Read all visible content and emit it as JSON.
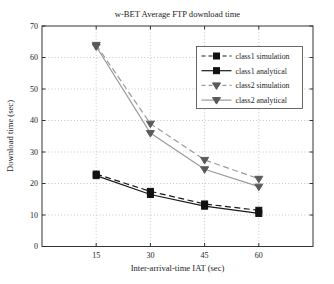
{
  "chart_data": {
    "type": "line",
    "title": "w-BET Average FTP download time",
    "xlabel": "Inter-arrival-time IAT (sec)",
    "ylabel": "Download time (sec)",
    "x": [
      15,
      30,
      45,
      60
    ],
    "xlim": [
      0,
      75
    ],
    "ylim": [
      0,
      70
    ],
    "xticks": [
      15,
      30,
      45,
      60
    ],
    "yticks": [
      0,
      10,
      20,
      30,
      40,
      50,
      60,
      70
    ],
    "grid": true,
    "legend_position": "upper right",
    "series": [
      {
        "name": "class1 simulation",
        "values": [
          23,
          17.5,
          13.5,
          11.5
        ],
        "line_style": "dashed",
        "marker": "square",
        "line_color": "#1a1a1a",
        "marker_color": "#111111"
      },
      {
        "name": "class1 analytical",
        "values": [
          22.5,
          16.5,
          12.8,
          10.5
        ],
        "line_style": "solid",
        "marker": "square",
        "line_color": "#1a1a1a",
        "marker_color": "#111111"
      },
      {
        "name": "class2 simulation",
        "values": [
          64,
          39,
          27.5,
          21.5
        ],
        "line_style": "dashed",
        "marker": "triangle-down",
        "line_color": "#9a9a9a",
        "marker_color": "#5a5a5a"
      },
      {
        "name": "class2 analytical",
        "values": [
          63.5,
          36,
          24.5,
          19
        ],
        "line_style": "solid",
        "marker": "triangle-down",
        "line_color": "#9a9a9a",
        "marker_color": "#5a5a5a"
      }
    ],
    "colors": {
      "plot_box": "#333333",
      "grid": "#b8b8b8",
      "background": "#ffffff",
      "legend_border": "#444444"
    }
  }
}
